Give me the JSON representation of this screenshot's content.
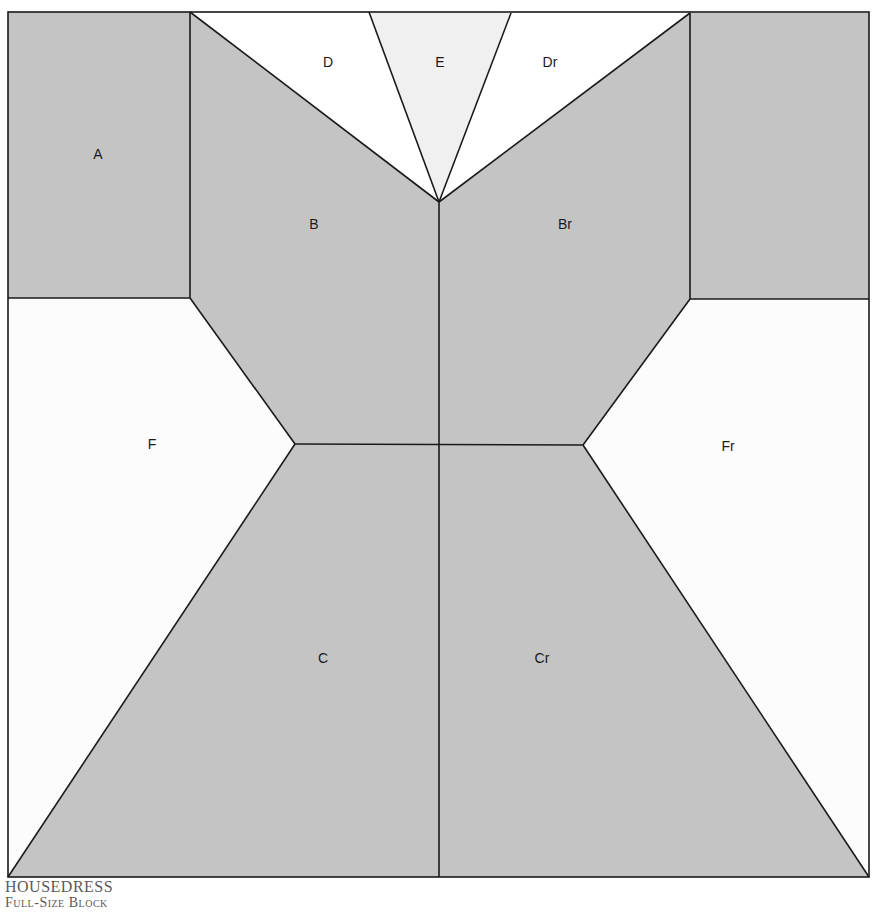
{
  "block": {
    "name": "HOUSEDRESS",
    "subtitle": "Full-Size Block",
    "colors": {
      "dark_fill": "#c4c4c4",
      "light_fill": "#f0f0f0",
      "white_fill": "#ffffff",
      "background_fill": "#fcfcfc",
      "line": "#1a1a1a"
    },
    "pieces": [
      {
        "id": "A",
        "label": "A",
        "fill": "dark"
      },
      {
        "id": "A-right",
        "label": "",
        "fill": "dark"
      },
      {
        "id": "B",
        "label": "B",
        "fill": "dark"
      },
      {
        "id": "Br",
        "label": "Br",
        "fill": "dark"
      },
      {
        "id": "C",
        "label": "C",
        "fill": "dark"
      },
      {
        "id": "Cr",
        "label": "Cr",
        "fill": "dark"
      },
      {
        "id": "D",
        "label": "D",
        "fill": "white"
      },
      {
        "id": "Dr",
        "label": "Dr",
        "fill": "white"
      },
      {
        "id": "E",
        "label": "E",
        "fill": "light"
      },
      {
        "id": "F",
        "label": "F",
        "fill": "background"
      },
      {
        "id": "Fr",
        "label": "Fr",
        "fill": "background"
      }
    ]
  }
}
